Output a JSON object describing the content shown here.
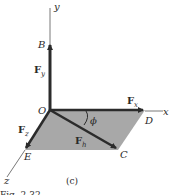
{
  "diagram": {
    "caption": "(c)",
    "figure_label": "Fig. 2.32",
    "axes": {
      "x": "x",
      "y": "y",
      "z": "z"
    },
    "points": {
      "origin": "O",
      "B": "B",
      "C": "C",
      "D": "D",
      "E": "E"
    },
    "vectors": {
      "Fy": {
        "main": "F",
        "sub": "y"
      },
      "Fx": {
        "main": "F",
        "sub": "x"
      },
      "Fz": {
        "main": "F",
        "sub": "z"
      },
      "Fh": {
        "main": "F",
        "sub": "h"
      }
    },
    "angle": "ϕ",
    "colors": {
      "plane": "#a8a8a8",
      "vector": "#2b2b2b",
      "axis": "#555555"
    }
  }
}
